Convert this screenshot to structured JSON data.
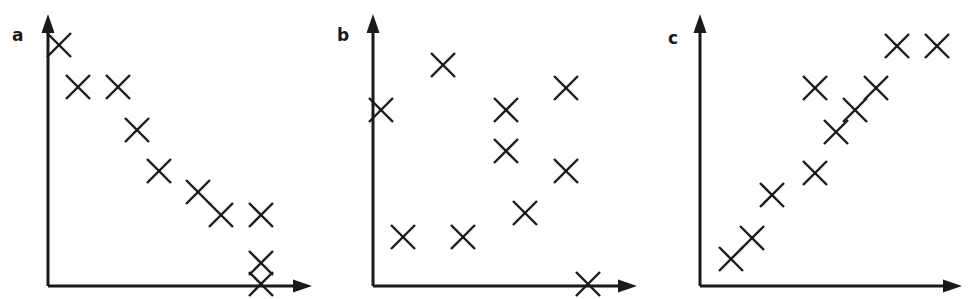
{
  "figure": {
    "width": 975,
    "height": 299,
    "background": "#ffffff",
    "ink_color": "#1a1a1a",
    "marker_glyph": "x-cross-marker",
    "marker_size": 24,
    "stroke_width": 2.4
  },
  "chart_data": [
    {
      "type": "scatter",
      "panel": "a",
      "title": "a",
      "label": "a",
      "xlabel": "",
      "ylabel": "",
      "relationship": "negative correlation",
      "axes": {
        "origin_x": 48,
        "origin_y": 286,
        "y_axis_top": 14,
        "x_axis_right": 312,
        "arrowheads": true,
        "grid": false,
        "ticks": false,
        "tick_labels": []
      },
      "xlim": [
        48,
        312
      ],
      "ylim": [
        286,
        14
      ],
      "points": [
        {
          "x": 59,
          "y": 45
        },
        {
          "x": 78,
          "y": 87
        },
        {
          "x": 118,
          "y": 87
        },
        {
          "x": 137,
          "y": 130
        },
        {
          "x": 159,
          "y": 171
        },
        {
          "x": 198,
          "y": 192
        },
        {
          "x": 221,
          "y": 215
        },
        {
          "x": 261,
          "y": 215
        },
        {
          "x": 261,
          "y": 263
        },
        {
          "x": 261,
          "y": 284
        }
      ]
    },
    {
      "type": "scatter",
      "panel": "b",
      "title": "b",
      "label": "b",
      "xlabel": "",
      "ylabel": "",
      "relationship": "no correlation",
      "axes": {
        "origin_x": 373,
        "origin_y": 286,
        "y_axis_top": 14,
        "x_axis_right": 637,
        "arrowheads": true,
        "grid": false,
        "ticks": false,
        "tick_labels": []
      },
      "xlim": [
        373,
        637
      ],
      "ylim": [
        286,
        14
      ],
      "points": [
        {
          "x": 443,
          "y": 65
        },
        {
          "x": 381,
          "y": 110
        },
        {
          "x": 566,
          "y": 88
        },
        {
          "x": 506,
          "y": 110
        },
        {
          "x": 506,
          "y": 151
        },
        {
          "x": 566,
          "y": 171
        },
        {
          "x": 525,
          "y": 213
        },
        {
          "x": 403,
          "y": 237
        },
        {
          "x": 463,
          "y": 237
        },
        {
          "x": 588,
          "y": 284
        }
      ]
    },
    {
      "type": "scatter",
      "panel": "c",
      "title": "c",
      "label": "c",
      "xlabel": "",
      "ylabel": "",
      "relationship": "positive correlation",
      "axes": {
        "origin_x": 700,
        "origin_y": 286,
        "y_axis_top": 14,
        "x_axis_right": 962,
        "arrowheads": true,
        "grid": false,
        "ticks": false,
        "tick_labels": []
      },
      "xlim": [
        700,
        962
      ],
      "ylim": [
        286,
        14
      ],
      "points": [
        {
          "x": 731,
          "y": 259
        },
        {
          "x": 752,
          "y": 238
        },
        {
          "x": 772,
          "y": 195
        },
        {
          "x": 815,
          "y": 173
        },
        {
          "x": 815,
          "y": 88
        },
        {
          "x": 836,
          "y": 132
        },
        {
          "x": 855,
          "y": 110
        },
        {
          "x": 876,
          "y": 88
        },
        {
          "x": 897,
          "y": 46
        },
        {
          "x": 937,
          "y": 46
        }
      ]
    }
  ],
  "panels": [
    {
      "key": "a",
      "label": "a",
      "label_x": 12,
      "label_y": 27
    },
    {
      "key": "b",
      "label": "b",
      "label_x": 337,
      "label_y": 27
    },
    {
      "key": "c",
      "label": "c",
      "label_x": 668,
      "label_y": 30
    }
  ]
}
